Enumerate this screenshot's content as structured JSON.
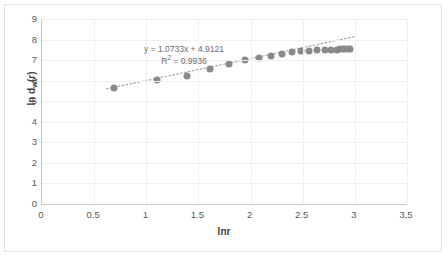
{
  "chart_data": {
    "type": "scatter",
    "title": "",
    "xlabel": "lnr",
    "ylabel": "ln d_w(r)",
    "ylabel_base": "ln d",
    "ylabel_sub": "w",
    "ylabel_tail": "(r)",
    "xlim": [
      0,
      3.5
    ],
    "ylim": [
      0,
      9
    ],
    "xticks": [
      "0",
      "0.5",
      "1",
      "1.5",
      "2",
      "2.5",
      "3",
      "3.5"
    ],
    "xtick_values": [
      0,
      0.5,
      1,
      1.5,
      2,
      2.5,
      3,
      3.5
    ],
    "yticks": [
      "0",
      "1",
      "2",
      "3",
      "4",
      "5",
      "6",
      "7",
      "8",
      "9"
    ],
    "ytick_values": [
      0,
      1,
      2,
      3,
      4,
      5,
      6,
      7,
      8,
      9
    ],
    "grid": true,
    "legend": "none",
    "marker_color": "#898989",
    "trendline_color": "#a6a6a6",
    "trendline_style": "dotted",
    "annotations": [
      "y = 1.0733x + 4.9121",
      "R2 = 0.9936"
    ],
    "equation": "y = 1.0733x + 4.9121",
    "r_squared_label": "R",
    "r_squared_exp": "2",
    "r_squared_value": " = 0.9936",
    "fit": {
      "slope": 1.0733,
      "intercept": 4.9121,
      "r2": 0.9936
    },
    "x": [
      0.69,
      1.1,
      1.39,
      1.61,
      1.79,
      1.95,
      2.08,
      2.2,
      2.3,
      2.4,
      2.48,
      2.56,
      2.64,
      2.71,
      2.77,
      2.83,
      2.86,
      2.89,
      2.91,
      2.93,
      2.95
    ],
    "y": [
      5.65,
      6.01,
      6.22,
      6.56,
      6.82,
      6.99,
      7.12,
      7.22,
      7.3,
      7.38,
      7.43,
      7.46,
      7.48,
      7.49,
      7.5,
      7.51,
      7.52,
      7.53,
      7.54,
      7.54,
      7.55
    ],
    "points": [
      [
        0.69,
        5.65
      ],
      [
        1.1,
        6.01
      ],
      [
        1.39,
        6.22
      ],
      [
        1.61,
        6.56
      ],
      [
        1.79,
        6.82
      ],
      [
        1.95,
        6.99
      ],
      [
        2.08,
        7.12
      ],
      [
        2.2,
        7.22
      ],
      [
        2.3,
        7.3
      ],
      [
        2.4,
        7.38
      ],
      [
        2.48,
        7.43
      ],
      [
        2.56,
        7.46
      ],
      [
        2.64,
        7.48
      ],
      [
        2.71,
        7.49
      ],
      [
        2.77,
        7.5
      ],
      [
        2.83,
        7.51
      ],
      [
        2.86,
        7.52
      ],
      [
        2.89,
        7.53
      ],
      [
        2.91,
        7.54
      ],
      [
        2.93,
        7.54
      ],
      [
        2.95,
        7.55
      ]
    ],
    "trendline_endpoints": [
      [
        0.62,
        5.58
      ],
      [
        3.0,
        8.13
      ]
    ]
  }
}
